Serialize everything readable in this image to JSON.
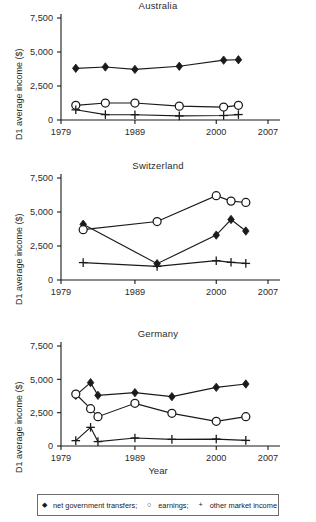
{
  "figure": {
    "xlabel": "Year",
    "ylabel": "D1 average income ($)",
    "y_ticks": [
      "0",
      "2,500",
      "5,000",
      "7,500"
    ],
    "x_ticks": [
      "1979",
      "1989",
      "2000",
      "2007"
    ],
    "line_color": "#1a1a1a"
  },
  "legend": {
    "items": [
      {
        "marker": "diamond",
        "glyph": "◆",
        "label": "net government transfers;"
      },
      {
        "marker": "circle",
        "glyph": "○",
        "label": "earnings;"
      },
      {
        "marker": "plus",
        "glyph": "+",
        "label": "other market income"
      }
    ]
  },
  "chart_data": [
    {
      "type": "line",
      "title": "Australia",
      "xlabel": "",
      "ylabel": "D1 average income ($)",
      "xlim": [
        1979,
        2007
      ],
      "ylim": [
        0,
        7500
      ],
      "xticks": [
        1979,
        1989,
        2000,
        2007
      ],
      "yticks": [
        0,
        2500,
        5000,
        7500
      ],
      "grid": false,
      "legend_position": "bottom",
      "x": [
        1981,
        1985,
        1989,
        1995,
        2001,
        2003
      ],
      "series": [
        {
          "name": "net government transfers",
          "marker": "diamond",
          "values": [
            3800,
            3900,
            3720,
            3950,
            4400,
            4430
          ]
        },
        {
          "name": "earnings",
          "marker": "circle",
          "values": [
            1080,
            1250,
            1250,
            1020,
            950,
            1080
          ]
        },
        {
          "name": "other market income",
          "marker": "plus",
          "values": [
            750,
            400,
            390,
            300,
            330,
            400
          ]
        }
      ]
    },
    {
      "type": "line",
      "title": "Switzerland",
      "xlabel": "",
      "ylabel": "D1 average income ($)",
      "xlim": [
        1979,
        2007
      ],
      "ylim": [
        0,
        7500
      ],
      "xticks": [
        1979,
        1989,
        2000,
        2007
      ],
      "yticks": [
        0,
        2500,
        5000,
        7500
      ],
      "grid": false,
      "legend_position": "bottom",
      "x": [
        1982,
        1992,
        2000,
        2002,
        2004
      ],
      "series": [
        {
          "name": "net government transfers",
          "marker": "diamond",
          "values": [
            4100,
            1200,
            3300,
            4450,
            3600
          ]
        },
        {
          "name": "earnings",
          "marker": "circle",
          "values": [
            3700,
            4300,
            6200,
            5800,
            5700
          ]
        },
        {
          "name": "other market income",
          "marker": "plus",
          "values": [
            1280,
            1000,
            1420,
            1300,
            1220
          ]
        }
      ]
    },
    {
      "type": "line",
      "title": "Germany",
      "xlabel": "Year",
      "ylabel": "D1 average income ($)",
      "xlim": [
        1979,
        2007
      ],
      "ylim": [
        0,
        7500
      ],
      "xticks": [
        1979,
        1989,
        2000,
        2007
      ],
      "yticks": [
        0,
        2500,
        5000,
        7500
      ],
      "grid": false,
      "legend_position": "bottom",
      "x": [
        1981,
        1983,
        1984,
        1989,
        1994,
        2000,
        2004
      ],
      "series": [
        {
          "name": "net government transfers",
          "marker": "diamond",
          "values": [
            3800,
            4750,
            3800,
            4000,
            3700,
            4400,
            4650
          ]
        },
        {
          "name": "earnings",
          "marker": "circle",
          "values": [
            3900,
            2800,
            2200,
            3200,
            2450,
            1850,
            2200
          ]
        },
        {
          "name": "other market income",
          "marker": "plus",
          "values": [
            400,
            1400,
            330,
            600,
            500,
            520,
            420
          ]
        }
      ]
    }
  ]
}
